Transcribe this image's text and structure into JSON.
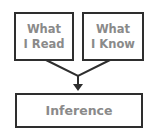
{
  "diagram": {
    "nodes": [
      {
        "id": "read",
        "line1": "What",
        "line2": "I Read"
      },
      {
        "id": "know",
        "line1": "What",
        "line2": "I Know"
      },
      {
        "id": "inference",
        "label": "Inference"
      }
    ],
    "edges": [
      {
        "from": "read",
        "to": "inference"
      },
      {
        "from": "know",
        "to": "inference"
      }
    ],
    "colors": {
      "border": "#2e2e2e",
      "text": "#8a8a8a"
    }
  }
}
